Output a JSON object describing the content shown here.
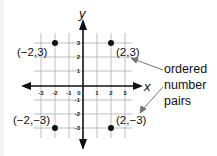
{
  "diagram": {
    "axes": {
      "x_label": "x",
      "y_label": "y",
      "x_ticks": [
        "-3",
        "-2",
        "-1",
        "0",
        "1",
        "2",
        "3"
      ],
      "y_ticks": [
        "3",
        "2",
        "1",
        "-1",
        "-2",
        "-3"
      ]
    },
    "points": [
      {
        "label": "(−2,3)",
        "x": -2,
        "y": 3
      },
      {
        "label": "(2,3)",
        "x": 2,
        "y": 3
      },
      {
        "label": "(−2,−3)",
        "x": -2,
        "y": -3
      },
      {
        "label": "(2,−3)",
        "x": 2,
        "y": -3
      }
    ],
    "annotation": {
      "lines": [
        "ordered",
        "number",
        "pairs"
      ]
    },
    "colors": {
      "grid": "#b8b8b8",
      "axis": "#111111",
      "point": "#111111",
      "pointer": "#777777",
      "background": "#ffffff"
    }
  }
}
